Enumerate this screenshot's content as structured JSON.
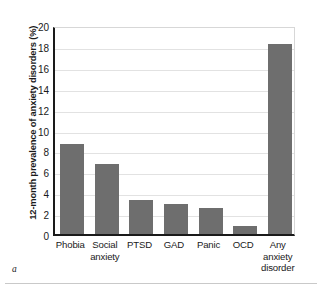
{
  "chart_data": {
    "type": "bar",
    "title": "",
    "subtitle": "",
    "xlabel": "",
    "ylabel": "12-month prevalence of anxiety disorders (%)",
    "ylim": [
      0,
      20
    ],
    "ytick_step": 2,
    "yticks": [
      "20",
      "18",
      "16",
      "14",
      "12",
      "10",
      "8",
      "6",
      "4",
      "2",
      "0"
    ],
    "grid": "horizontal",
    "legend": "none",
    "bar_color": "#6e6e6e",
    "axis_color": "#1a1a1a",
    "gridline_color": "#e2e2e2",
    "categories": [
      "Phobia",
      "Social anxiety",
      "PTSD",
      "GAD",
      "Panic",
      "OCD",
      "Any anxiety disorder"
    ],
    "category_lines": [
      [
        "Phobia"
      ],
      [
        "Social",
        "anxiety"
      ],
      [
        "PTSD"
      ],
      [
        "GAD"
      ],
      [
        "Panic"
      ],
      [
        "OCD"
      ],
      [
        "Any",
        "anxiety",
        "disorder"
      ]
    ],
    "values": [
      8.6,
      6.7,
      3.3,
      2.9,
      2.5,
      0.8,
      18.2
    ]
  },
  "caption": {
    "panel_letter": "a"
  }
}
